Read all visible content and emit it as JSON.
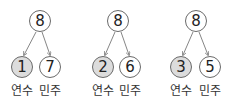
{
  "groups": [
    {
      "total": "8",
      "left": "1",
      "right": "7",
      "left_label": "연수",
      "right_label": "민주"
    },
    {
      "total": "8",
      "left": "2",
      "right": "6",
      "left_label": "연수",
      "right_label": "민주"
    },
    {
      "total": "8",
      "left": "3",
      "right": "5",
      "left_label": "연수",
      "right_label": "민주"
    }
  ],
  "colors": {
    "shaded": "#dcdcdc",
    "stroke": "#6a6a6a"
  }
}
